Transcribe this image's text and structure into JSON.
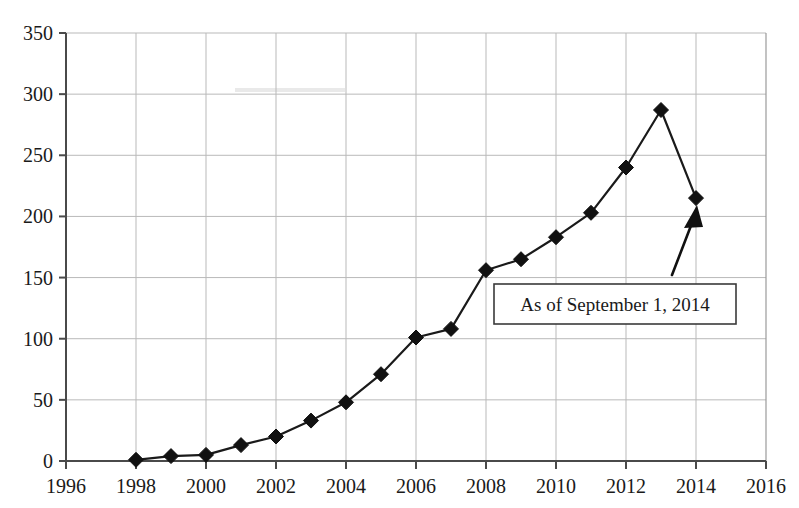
{
  "chart_data": {
    "type": "line",
    "title": "",
    "subtitle": "",
    "xlabel": "",
    "ylabel": "",
    "xlim": [
      1996,
      2016
    ],
    "ylim": [
      0,
      350
    ],
    "grid": true,
    "legend_position": "none",
    "marker": "diamond",
    "x": [
      1998,
      1999,
      2000,
      2001,
      2002,
      2003,
      2004,
      2005,
      2006,
      2007,
      2008,
      2009,
      2010,
      2011,
      2012,
      2013,
      2014
    ],
    "values": [
      1,
      4,
      5,
      13,
      20,
      33,
      48,
      71,
      101,
      108,
      156,
      165,
      183,
      203,
      240,
      287,
      215
    ],
    "series": [
      {
        "name": "",
        "values": [
          1,
          4,
          5,
          13,
          20,
          33,
          48,
          71,
          101,
          108,
          156,
          165,
          183,
          203,
          240,
          287,
          215
        ]
      }
    ],
    "xticks": [
      1996,
      1998,
      2000,
      2002,
      2004,
      2006,
      2008,
      2010,
      2012,
      2014,
      2016
    ],
    "xtick_labels": [
      "1996",
      "1998",
      "2000",
      "2002",
      "2004",
      "2006",
      "2008",
      "2010",
      "2012",
      "2014",
      "2016"
    ],
    "yticks": [
      0,
      50,
      100,
      150,
      200,
      250,
      300,
      350
    ],
    "ytick_labels": [
      "0",
      "50",
      "100",
      "150",
      "200",
      "250",
      "300",
      "350"
    ],
    "annotations": [
      {
        "text": "As of September 1, 2014",
        "kind": "boxed-label-with-arrow",
        "points_to_x": 2014,
        "points_to_y": 215
      }
    ],
    "colors": {
      "line": "#1a1a1a",
      "marker": "#111111",
      "grid": "#b9b9b9",
      "axis": "#4a4a4a",
      "background": "#ffffff",
      "annotation_border": "#3a3a3a",
      "annotation_text": "#1a1a1a"
    }
  }
}
